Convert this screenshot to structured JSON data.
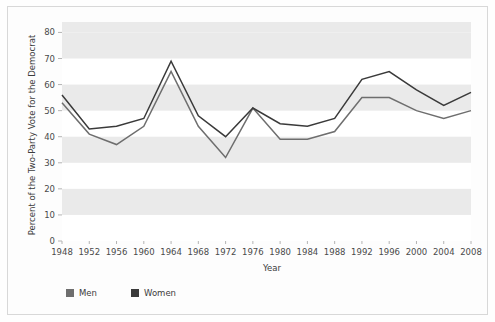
{
  "chart_data": {
    "type": "line",
    "title": "",
    "xlabel": "Year",
    "ylabel": "Percent of the Two-Party Vote for the Democrat",
    "categories": [
      "1948",
      "1952",
      "1956",
      "1960",
      "1964",
      "1968",
      "1972",
      "1976",
      "1980",
      "1984",
      "1988",
      "1992",
      "1996",
      "2000",
      "2004",
      "2008"
    ],
    "xticklabels": [
      "1948",
      "1952",
      "1956",
      "1960",
      "1964",
      "1968",
      "1972",
      "1976",
      "1980",
      "1984",
      "1988",
      "1992",
      "1996",
      "2000",
      "2004",
      "2008"
    ],
    "yticklabels": [
      "0",
      "10",
      "20",
      "30",
      "40",
      "50",
      "60",
      "70",
      "80"
    ],
    "yticks": [
      0,
      10,
      20,
      30,
      40,
      50,
      60,
      70,
      80
    ],
    "ylim": [
      0,
      84
    ],
    "grid": "horizontal-bands",
    "legend_position": "bottom-left",
    "series": [
      {
        "name": "Men",
        "color": "#6e6e6e",
        "values": [
          53,
          41,
          37,
          44,
          65,
          44,
          32,
          51,
          39,
          39,
          42,
          55,
          55,
          50,
          47,
          50
        ]
      },
      {
        "name": "Women",
        "color": "#3a3a3a",
        "values": [
          56,
          43,
          44,
          47,
          69,
          48,
          40,
          51,
          45,
          44,
          47,
          62,
          65,
          58,
          52,
          57
        ]
      }
    ]
  },
  "legend": {
    "items": [
      {
        "label": "Men",
        "swatch_color": "#6e6e6e"
      },
      {
        "label": "Women",
        "swatch_color": "#3a3a3a"
      }
    ]
  },
  "axes": {
    "x_title": "Year",
    "y_title": "Percent of the Two-Party Vote for the Democrat"
  },
  "colors": {
    "men": "#6e6e6e",
    "women": "#3a3a3a",
    "band": "#eaeaea",
    "frame": "#d8d8d8",
    "text": "#3c3c3c"
  }
}
